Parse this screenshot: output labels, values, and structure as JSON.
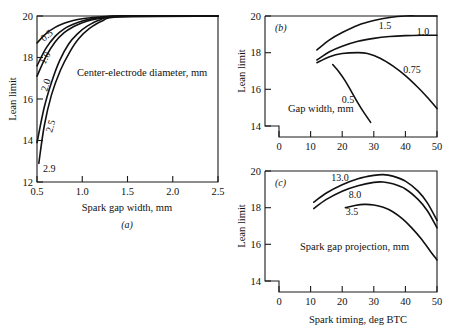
{
  "figure": {
    "caption_a": "(a)",
    "caption_b": "(b)",
    "caption_c": "(c)"
  },
  "chart_data": [
    {
      "type": "line",
      "panel": "(a)",
      "title": "",
      "xlabel": "Spark gap width, mm",
      "ylabel": "Lean limit",
      "annotation": "Center-electrode diameter, mm",
      "xlim": [
        0.5,
        2.5
      ],
      "ylim": [
        12,
        20
      ],
      "xticks": [
        0.5,
        1.0,
        1.5,
        2.0,
        2.5
      ],
      "xticklabels": [
        "0.5",
        "1.0",
        "1.5",
        "2.0",
        "2.5"
      ],
      "yticks": [
        12,
        14,
        16,
        18,
        20
      ],
      "yticklabels": [
        "12",
        "14",
        "16",
        "18",
        "20"
      ],
      "grid": false,
      "legend": "inline-curve-labels",
      "series": [
        {
          "name": "0.5",
          "label": "0.5",
          "x": [
            0.5,
            0.6,
            0.7,
            0.8,
            0.9,
            1.0,
            1.1,
            1.25,
            1.45,
            2.5
          ],
          "y": [
            18.7,
            19.15,
            19.45,
            19.65,
            19.78,
            19.87,
            19.92,
            19.97,
            20.0,
            20.0
          ]
        },
        {
          "name": "1.0",
          "label": "1.0",
          "x": [
            0.5,
            0.6,
            0.7,
            0.8,
            0.9,
            1.0,
            1.1,
            1.25,
            1.45,
            2.5
          ],
          "y": [
            17.6,
            18.45,
            19.02,
            19.38,
            19.6,
            19.76,
            19.86,
            19.94,
            20.0,
            20.0
          ]
        },
        {
          "name": "2.0",
          "label": "2.0",
          "x": [
            0.5,
            0.6,
            0.7,
            0.8,
            0.9,
            1.0,
            1.1,
            1.25,
            1.45,
            2.5
          ],
          "y": [
            17.1,
            18.05,
            18.75,
            19.2,
            19.48,
            19.68,
            19.81,
            19.92,
            20.0,
            20.0
          ]
        },
        {
          "name": "2.5",
          "label": "2.5",
          "x": [
            0.5,
            0.58,
            0.66,
            0.75,
            0.85,
            0.95,
            1.05,
            1.2,
            1.4,
            2.5
          ],
          "y": [
            13.9,
            15.6,
            16.8,
            17.85,
            18.65,
            19.15,
            19.5,
            19.82,
            19.98,
            20.0
          ]
        },
        {
          "name": "2.9",
          "label": "2.9",
          "x": [
            0.52,
            0.58,
            0.66,
            0.76,
            0.86,
            0.96,
            1.08,
            1.22,
            1.42,
            2.5
          ],
          "y": [
            12.9,
            14.7,
            16.2,
            17.4,
            18.25,
            18.9,
            19.4,
            19.76,
            19.96,
            20.0
          ]
        }
      ]
    },
    {
      "type": "line",
      "panel": "(b)",
      "title": "",
      "xlabel": "",
      "ylabel": "Lean limit",
      "annotation": "Gap width, mm",
      "xlim": [
        0,
        50
      ],
      "ylim": [
        14,
        20
      ],
      "xticks": [
        0,
        10,
        20,
        30,
        40,
        50
      ],
      "xticklabels": [
        "0",
        "10",
        "20",
        "30",
        "40",
        "50"
      ],
      "yticks": [
        14,
        16,
        18,
        20
      ],
      "yticklabels": [
        "14",
        "16",
        "18",
        "20"
      ],
      "grid": false,
      "legend": "inline-curve-labels",
      "series": [
        {
          "name": "1.5",
          "label": "1.5",
          "x": [
            12,
            16,
            20,
            25,
            30,
            35,
            40,
            45,
            50
          ],
          "y": [
            18.15,
            18.7,
            19.1,
            19.5,
            19.75,
            19.92,
            20.0,
            20.0,
            20.0
          ]
        },
        {
          "name": "1.0",
          "label": "1.0",
          "x": [
            12,
            16,
            20,
            25,
            30,
            35,
            40,
            45,
            50
          ],
          "y": [
            17.6,
            18.05,
            18.35,
            18.62,
            18.78,
            18.88,
            18.93,
            18.95,
            18.95
          ]
        },
        {
          "name": "0.75",
          "label": "0.75",
          "x": [
            12,
            16,
            20,
            25,
            28,
            32,
            36,
            40,
            44,
            47,
            50
          ],
          "y": [
            17.45,
            17.78,
            17.95,
            18.0,
            17.95,
            17.7,
            17.28,
            16.75,
            16.1,
            15.55,
            14.95
          ]
        },
        {
          "name": "0.5",
          "label": "0.5",
          "x": [
            17,
            19,
            21,
            23,
            25,
            27,
            29
          ],
          "y": [
            17.35,
            16.95,
            16.45,
            15.85,
            15.25,
            14.7,
            14.2
          ]
        }
      ]
    },
    {
      "type": "line",
      "panel": "(c)",
      "title": "",
      "xlabel": "Spark timing, deg BTC",
      "ylabel": "Lean limit",
      "annotation": "Spark gap projection, mm",
      "xlim": [
        0,
        50
      ],
      "ylim": [
        14,
        20
      ],
      "xticks": [
        0,
        10,
        20,
        30,
        40,
        50
      ],
      "xticklabels": [
        "0",
        "10",
        "20",
        "30",
        "40",
        "50"
      ],
      "yticks": [
        14,
        16,
        18,
        20
      ],
      "yticklabels": [
        "14",
        "16",
        "18",
        "20"
      ],
      "grid": false,
      "legend": "inline-curve-labels",
      "series": [
        {
          "name": "13.0",
          "label": "13.0",
          "x": [
            11,
            15,
            20,
            25,
            30,
            33,
            36,
            40,
            44,
            47,
            50
          ],
          "y": [
            18.3,
            18.8,
            19.25,
            19.58,
            19.76,
            19.8,
            19.72,
            19.45,
            18.9,
            18.25,
            17.3
          ]
        },
        {
          "name": "8.0",
          "label": "8.0",
          "x": [
            11,
            15,
            20,
            25,
            30,
            33,
            36,
            40,
            44,
            47,
            50
          ],
          "y": [
            17.95,
            18.45,
            18.9,
            19.2,
            19.38,
            19.4,
            19.3,
            19.02,
            18.45,
            17.82,
            16.9
          ]
        },
        {
          "name": "3.5",
          "label": "3.5",
          "x": [
            21,
            24,
            27,
            30,
            33,
            36,
            39,
            42,
            45,
            48,
            50
          ],
          "y": [
            18.0,
            18.12,
            18.18,
            18.15,
            18.02,
            17.78,
            17.4,
            16.9,
            16.3,
            15.6,
            15.15
          ]
        }
      ]
    }
  ]
}
